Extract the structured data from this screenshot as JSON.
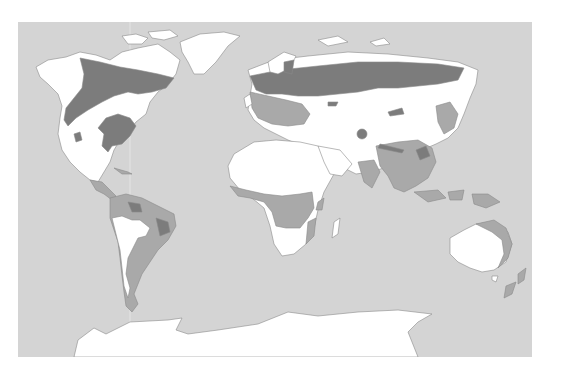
{
  "map": {
    "type": "world-vegetation-zones",
    "projection": "equirectangular-like",
    "colors": {
      "page_background": "#ffffff",
      "ocean": "#d4d4d4",
      "land_light": "#ffffff",
      "zone_medium": "#a9a9a9",
      "zone_dark": "#7c7c7c",
      "coastline": "#8a8a8a"
    },
    "legend": [],
    "labels": [],
    "zones": [
      {
        "id": "light",
        "shade": "white",
        "description": "tundra / ice / desert / grassland regions"
      },
      {
        "id": "medium",
        "shade": "medium-gray",
        "description": "tropical & temperate forest regions"
      },
      {
        "id": "dark",
        "shade": "dark-gray",
        "description": "boreal / coniferous & dense forest regions"
      }
    ],
    "continents": [
      "North America",
      "South America",
      "Greenland",
      "Europe",
      "Africa",
      "Asia",
      "Australia",
      "New Zealand",
      "Antarctica"
    ]
  }
}
